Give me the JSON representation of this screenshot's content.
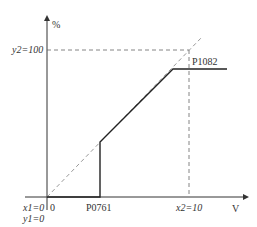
{
  "diagram": {
    "y_axis_label": "%",
    "x_axis_label": "V",
    "y2_label": "y2=100",
    "x2_label": "x2=10",
    "origin_x_label": "x1=0",
    "origin_y_label": "y1=0",
    "zero_label": "0",
    "p0761_label": "P0761",
    "p1082_label": "P1082",
    "colors": {
      "line": "#222222",
      "dashed": "#888888",
      "axis": "#333333"
    }
  }
}
